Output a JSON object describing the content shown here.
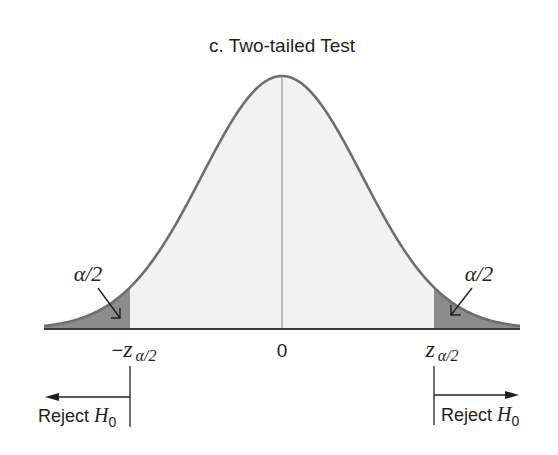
{
  "title": "c. Two-tailed Test",
  "labels": {
    "left_tail_area": "α/2",
    "right_tail_area": "α/2",
    "left_critical": {
      "prefix": "−",
      "var": "z",
      "sub": "α/2"
    },
    "center": "0",
    "right_critical": {
      "var": "z",
      "sub": "α/2"
    },
    "left_reject": {
      "text": "Reject ",
      "var": "H",
      "sub": "0"
    },
    "right_reject": {
      "text": "Reject ",
      "var": "H",
      "sub": "0"
    }
  },
  "colors": {
    "curve": "#6d6e71",
    "tail_fill": "#8c8c8c",
    "body_fill": "#f2f2f2",
    "axis": "#3a3a3a",
    "text": "#231f20"
  },
  "geometry": {
    "center_x": 282,
    "axis_y": 329,
    "peak_y": 76,
    "sigma_px": 80,
    "left_cut_x": 130,
    "right_cut_x": 434,
    "x_start": 44,
    "x_end": 520
  }
}
